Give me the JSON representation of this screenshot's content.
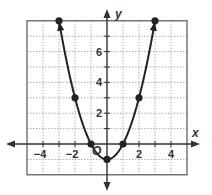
{
  "chart_data": {
    "type": "line",
    "title": "",
    "function": "y = x^2 - 1",
    "xlabel": "x",
    "ylabel": "y",
    "origin_label": "O",
    "xlim": [
      -5,
      5
    ],
    "ylim": [
      -2,
      8
    ],
    "grid": true,
    "grid_step": 1,
    "x_tick_labels": [
      {
        "value": -4,
        "label": "−4"
      },
      {
        "value": -2,
        "label": "−2"
      },
      {
        "value": 2,
        "label": "2"
      },
      {
        "value": 4,
        "label": "4"
      }
    ],
    "y_tick_labels": [
      {
        "value": 2,
        "label": "2"
      },
      {
        "value": 4,
        "label": "4"
      },
      {
        "value": 6,
        "label": "6"
      }
    ],
    "series": [
      {
        "name": "parabola",
        "x": [
          -3,
          -2,
          -1,
          0,
          1,
          2,
          3
        ],
        "y": [
          8,
          3,
          0,
          -1,
          0,
          3,
          8
        ],
        "markers": true,
        "end_arrows": true
      }
    ],
    "colors": {
      "curve": "#222222",
      "axis": "#333333",
      "grid": "#9a9a9a",
      "border": "#555555"
    }
  }
}
